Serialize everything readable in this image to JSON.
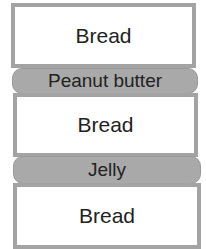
{
  "layers": [
    {
      "label": "Bread",
      "type": "bread"
    },
    {
      "label": "Peanut butter",
      "type": "filling"
    },
    {
      "label": "Bread",
      "type": "bread"
    },
    {
      "label": "Jelly",
      "type": "filling"
    },
    {
      "label": "Bread",
      "type": "bread"
    }
  ],
  "colors": {
    "bread_fill": "#ffffff",
    "bread_border": "#a3a3a3",
    "filling_fill": "#a9a9a9"
  }
}
